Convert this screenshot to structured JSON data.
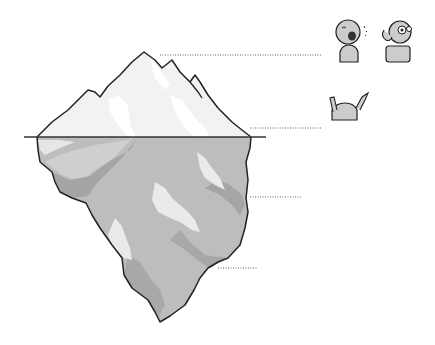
{
  "diagram": {
    "title": "",
    "type": "iceberg",
    "colors": {
      "background": "#ffffff",
      "outline": "#222222",
      "above_water": "#f2f2f2",
      "above_highlight": "#ffffff",
      "below_water": "#bdbdbd",
      "below_shadow": "#9e9e9e",
      "below_highlight": "#eaeaea",
      "waterline": "#333333",
      "leader": "#666666"
    },
    "levels": [
      {
        "label": "말 듣기",
        "icons": [
          "talking-person-icon",
          "listening-person-icon"
        ]
      },
      {
        "label": "몸말 듣기",
        "icons": [
          "gesturing-person-icon",
          "listening-person-icon"
        ]
      },
      {
        "label": "감정 듣기",
        "icons": [
          "happy-face-icon",
          "sad-face-icon",
          "angry-face-icon"
        ]
      },
      {
        "label": "의미, 가치, 욕구 듣기",
        "icons": [
          "compass-icon",
          "diamond-icon",
          "listening-boy-icon"
        ]
      }
    ]
  }
}
